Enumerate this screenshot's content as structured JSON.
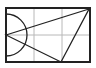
{
  "diagram": {
    "colors": {
      "background": "#ffffff",
      "outline": "#222222",
      "grid": "#b8b8b8"
    },
    "rectangle": {
      "x": 6,
      "y": 8,
      "width": 84,
      "height": 54
    },
    "grid": {
      "columns": 3,
      "rows": 2
    },
    "semicircle": {
      "cx": 6,
      "cy": 35,
      "r": 21
    },
    "triangle": {
      "points": [
        [
          6,
          35
        ],
        [
          89,
          9
        ],
        [
          61,
          62
        ]
      ]
    }
  }
}
